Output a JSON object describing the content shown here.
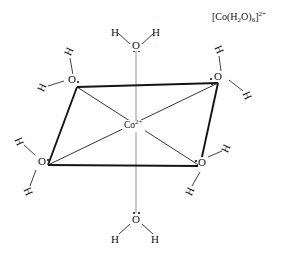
{
  "figure": {
    "title_formula": {
      "open_bracket": "[",
      "metal": "Co",
      "ligand_open": "(",
      "ligand_element_h": "H",
      "ligand_h_count": "2",
      "ligand_element_o": "O",
      "ligand_close": ")",
      "ligand_count": "6",
      "close_bracket": "]",
      "charge": "2+",
      "plain": "[Co(H2O)6]2+"
    },
    "center_atom": {
      "symbol": "Co",
      "charge": "2+"
    },
    "ligands": [
      {
        "position": "axial-top",
        "oxygen": "O",
        "hydrogens": [
          "H",
          "H"
        ],
        "lone_pairs": 2,
        "lone_pair_side": "below"
      },
      {
        "position": "equatorial-top-left",
        "oxygen": "O",
        "hydrogens": [
          "H",
          "H"
        ],
        "lone_pairs": 2,
        "lone_pair_side": "right"
      },
      {
        "position": "equatorial-top-right",
        "oxygen": "O",
        "hydrogens": [
          "H",
          "H"
        ],
        "lone_pairs": 2,
        "lone_pair_side": "left"
      },
      {
        "position": "equatorial-bottom-left",
        "oxygen": "O",
        "hydrogens": [
          "H",
          "H"
        ],
        "lone_pairs": 2,
        "lone_pair_side": "right"
      },
      {
        "position": "equatorial-bottom-right",
        "oxygen": "O",
        "hydrogens": [
          "H",
          "H"
        ],
        "lone_pairs": 2,
        "lone_pair_side": "left"
      },
      {
        "position": "axial-bottom",
        "oxygen": "O",
        "hydrogens": [
          "H",
          "H"
        ],
        "lone_pairs": 2,
        "lone_pair_side": "above"
      }
    ],
    "labels": {
      "h_symbol": "H",
      "o_symbol": "O"
    },
    "colors": {
      "background": "#ffffff",
      "bond_dark": "#1a1a1a",
      "bond_thin": "#3a3a3a",
      "bond_axial": "#9a9a9a",
      "text": "#111111"
    }
  }
}
